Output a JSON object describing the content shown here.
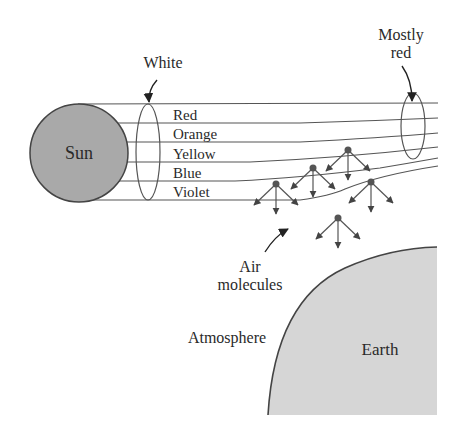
{
  "diagram": {
    "labels": {
      "sun": "Sun",
      "earth": "Earth",
      "white": "White",
      "mostly_red_line1": "Mostly",
      "mostly_red_line2": "red",
      "air_line1": "Air",
      "air_line2": "molecules",
      "atmosphere": "Atmosphere"
    },
    "color_bands": [
      {
        "label": "Red"
      },
      {
        "label": "Orange"
      },
      {
        "label": "Yellow"
      },
      {
        "label": "Blue"
      },
      {
        "label": "Violet"
      }
    ],
    "colors": {
      "sun_fill": "#a9a9a9",
      "earth_fill": "#d6d6d6",
      "stroke": "#444444",
      "text": "#2a2a2a"
    },
    "air_molecule_count": 5
  }
}
